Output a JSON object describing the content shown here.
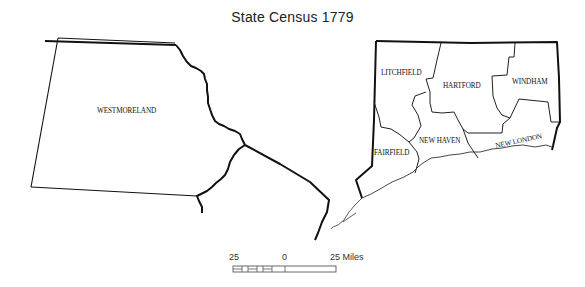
{
  "title": "State Census  1779",
  "maps": {
    "left": {
      "regions": [
        {
          "name": "WESTMORELAND"
        }
      ]
    },
    "right": {
      "regions": [
        {
          "name": "LITCHFIELD"
        },
        {
          "name": "HARTFORD"
        },
        {
          "name": "WINDHAM"
        },
        {
          "name": "NEW HAVEN"
        },
        {
          "name": "FAIRFIELD"
        },
        {
          "name": "NEW LONDON"
        }
      ]
    }
  },
  "scale_bar": {
    "left_label": "25",
    "middle_label": "0",
    "right_label": "25 Miles"
  }
}
